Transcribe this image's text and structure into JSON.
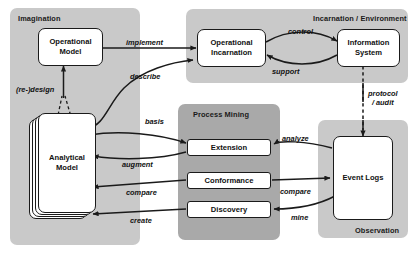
{
  "diagram": {
    "type": "block-flow-diagram",
    "colors": {
      "panel_light": "#c9c9c9",
      "panel_dark": "#a9a9a9",
      "node_fill": "#ffffff",
      "stroke": "#1a1a1a",
      "background": "#ffffff"
    }
  },
  "panels": [
    {
      "id": "imagination",
      "label": "Imagination",
      "label_align": "left"
    },
    {
      "id": "incarnation",
      "label": "Incarnation / Environment",
      "label_align": "right"
    },
    {
      "id": "process_mining",
      "label": "Process Mining",
      "label_align": "center"
    },
    {
      "id": "observation",
      "label": "Observation",
      "label_align": "right"
    }
  ],
  "nodes": [
    {
      "id": "operational_model",
      "label": "Operational\nModel",
      "line1": "Operational",
      "line2": "Model",
      "panel": "imagination"
    },
    {
      "id": "analytical_model",
      "label": "Analytical\nModel",
      "line1": "Analytical",
      "line2": "Model",
      "panel": "imagination",
      "stacked": true
    },
    {
      "id": "operational_incarnation",
      "label": "Operational\nIncarnation",
      "line1": "Operational",
      "line2": "Incarnation",
      "panel": "incarnation"
    },
    {
      "id": "information_system",
      "label": "Information\nSystem",
      "line1": "Information",
      "line2": "System",
      "panel": "incarnation"
    },
    {
      "id": "extension",
      "label": "Extension",
      "line1": "Extension",
      "line2": "",
      "panel": "process_mining"
    },
    {
      "id": "conformance",
      "label": "Conformance",
      "line1": "Conformance",
      "line2": "",
      "panel": "process_mining"
    },
    {
      "id": "discovery",
      "label": "Discovery",
      "line1": "Discovery",
      "line2": "",
      "panel": "process_mining"
    },
    {
      "id": "event_logs",
      "label": "Event Logs",
      "line1": "Event Logs",
      "line2": "",
      "panel": "observation"
    }
  ],
  "edges": [
    {
      "id": "implement",
      "label": "implement",
      "from": "operational_model",
      "to": "operational_incarnation",
      "style": "solid"
    },
    {
      "id": "redesign",
      "label": "(re-)design",
      "from": "analytical_model",
      "to": "operational_model",
      "style": "dashed"
    },
    {
      "id": "describe",
      "label": "describe",
      "from": "analytical_model",
      "to": "operational_incarnation",
      "style": "solid"
    },
    {
      "id": "control",
      "label": "control",
      "from": "operational_incarnation",
      "to": "information_system",
      "style": "solid"
    },
    {
      "id": "support",
      "label": "support",
      "from": "information_system",
      "to": "operational_incarnation",
      "style": "solid"
    },
    {
      "id": "protocol_audit",
      "label": "protocol\n/ audit",
      "line1": "protocol",
      "line2": "/ audit",
      "from": "information_system",
      "to": "event_logs",
      "style": "dashed"
    },
    {
      "id": "basis",
      "label": "basis",
      "from": "analytical_model",
      "to": "extension",
      "style": "solid"
    },
    {
      "id": "augment",
      "label": "augment",
      "from": "extension",
      "to": "analytical_model",
      "style": "solid"
    },
    {
      "id": "compare_left",
      "label": "compare",
      "from": "conformance",
      "to": "analytical_model",
      "style": "solid"
    },
    {
      "id": "create",
      "label": "create",
      "from": "discovery",
      "to": "analytical_model",
      "style": "solid"
    },
    {
      "id": "analyze",
      "label": "analyze",
      "from": "event_logs",
      "to": "extension",
      "style": "solid"
    },
    {
      "id": "compare_right",
      "label": "compare",
      "from": "conformance",
      "to": "event_logs",
      "style": "solid"
    },
    {
      "id": "mine",
      "label": "mine",
      "from": "event_logs",
      "to": "discovery",
      "style": "solid"
    }
  ]
}
